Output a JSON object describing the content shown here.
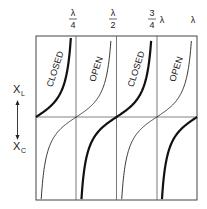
{
  "diagram": {
    "type": "stub-reactance-vs-length",
    "x_ticks": [
      {
        "num": "λ",
        "den": "4",
        "label": "λ/4",
        "frac": 0.25
      },
      {
        "num": "λ",
        "den": "2",
        "label": "λ/2",
        "frac": 0.5
      },
      {
        "num": "3",
        "den": "4",
        "suffix": "λ",
        "label": "3/4 λ",
        "frac": 0.75
      },
      {
        "num": "λ",
        "den": "",
        "label": "λ",
        "frac": 1.0
      }
    ],
    "y_axis": {
      "top_label": "X",
      "top_sub": "L",
      "bottom_label": "X",
      "bottom_sub": "C"
    },
    "curve_labels": [
      {
        "text": "CLOSED",
        "segment": 1
      },
      {
        "text": "OPEN",
        "segment": 2
      },
      {
        "text": "CLOSED",
        "segment": 3
      },
      {
        "text": "OPEN",
        "segment": 4
      }
    ],
    "series": [
      {
        "name": "closed",
        "function": "tan(2πl/λ)",
        "weight": "thick",
        "color": "#111111"
      },
      {
        "name": "open",
        "function": "-cot(2πl/λ)",
        "weight": "thin",
        "color": "#222222"
      }
    ]
  }
}
